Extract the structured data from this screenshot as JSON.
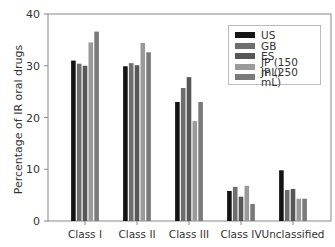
{
  "chart_data": {
    "type": "bar",
    "title": "",
    "xlabel": "",
    "ylabel": "Percentage of IR oral drugs",
    "ylim": [
      0,
      40
    ],
    "yticks": [
      0,
      10,
      20,
      30,
      40
    ],
    "grid": false,
    "legend_position": "upper right",
    "categories": [
      "Class I",
      "Class II",
      "Class III",
      "Class IV",
      "Unclassified"
    ],
    "series": [
      {
        "name": "US",
        "color": "#141414",
        "values": [
          31.0,
          29.9,
          23.0,
          5.8,
          9.8
        ]
      },
      {
        "name": "GB",
        "color": "#6e6e6e",
        "values": [
          30.4,
          30.5,
          25.7,
          6.6,
          6.0
        ]
      },
      {
        "name": "ES",
        "color": "#575757",
        "values": [
          30.0,
          30.1,
          27.8,
          4.7,
          6.2
        ]
      },
      {
        "name": "JP (150 mL)",
        "color": "#9a9a9a",
        "values": [
          34.5,
          34.4,
          19.3,
          6.8,
          4.3
        ]
      },
      {
        "name": "JP (250 mL)",
        "color": "#7a7a7a",
        "values": [
          36.6,
          32.6,
          23.0,
          3.3,
          4.3
        ]
      }
    ]
  }
}
